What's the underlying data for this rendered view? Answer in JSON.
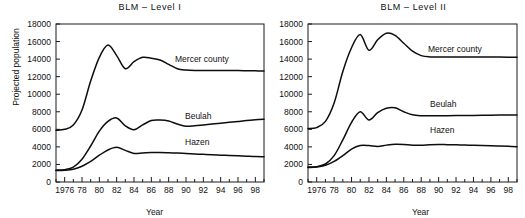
{
  "figure": {
    "ylabel": "Projected population",
    "xlabel_left": "Year",
    "xlabel_right": "Year"
  },
  "panels": [
    {
      "title": "BLM – Level I"
    },
    {
      "title": "BLM – Level II"
    }
  ],
  "series_labels": {
    "mercer": "Mercer county",
    "beulah": "Beulah",
    "hazen": "Hazen"
  },
  "axes": {
    "y_ticks": [
      "0",
      "2000",
      "4000",
      "6000",
      "8000",
      "10000",
      "12000",
      "14000",
      "16000",
      "18000"
    ],
    "x_ticks": [
      "1976",
      "78",
      "80",
      "82",
      "84",
      "86",
      "88",
      "90",
      "92",
      "94",
      "96",
      "98"
    ]
  },
  "chart_data": [
    {
      "type": "line",
      "title": "BLM – Level I",
      "xlabel": "Year",
      "ylabel": "Projected population",
      "xlim": [
        1975,
        1999
      ],
      "ylim": [
        0,
        18000
      ],
      "yticks": [
        0,
        2000,
        4000,
        6000,
        8000,
        10000,
        12000,
        14000,
        16000,
        18000
      ],
      "xticks": [
        1976,
        1978,
        1980,
        1982,
        1984,
        1986,
        1988,
        1990,
        1992,
        1994,
        1996,
        1998
      ],
      "xticklabels": [
        "1976",
        "78",
        "80",
        "82",
        "84",
        "86",
        "88",
        "90",
        "92",
        "94",
        "96",
        "98"
      ],
      "grid": false,
      "legend": "inline-annotations",
      "x": [
        1975,
        1976,
        1977,
        1978,
        1979,
        1980,
        1981,
        1982,
        1983,
        1984,
        1985,
        1986,
        1987,
        1988,
        1989,
        1990,
        1991,
        1992,
        1993,
        1994,
        1995,
        1996,
        1997,
        1998,
        1999
      ],
      "series": [
        {
          "name": "Mercer county",
          "values": [
            5900,
            6000,
            6500,
            8200,
            11500,
            14200,
            15600,
            14400,
            12900,
            13700,
            14200,
            14100,
            13900,
            13400,
            12900,
            12750,
            12700,
            12700,
            12700,
            12700,
            12700,
            12700,
            12680,
            12660,
            12650
          ]
        },
        {
          "name": "Beulah",
          "values": [
            1350,
            1400,
            1700,
            2600,
            4100,
            5800,
            6900,
            7300,
            6400,
            5950,
            6500,
            7000,
            7050,
            6950,
            6600,
            6350,
            6400,
            6500,
            6600,
            6700,
            6800,
            6900,
            7000,
            7080,
            7150
          ]
        },
        {
          "name": "Hazen",
          "values": [
            1300,
            1330,
            1450,
            1800,
            2350,
            3050,
            3650,
            3950,
            3600,
            3250,
            3300,
            3350,
            3350,
            3330,
            3300,
            3250,
            3200,
            3150,
            3100,
            3060,
            3020,
            2980,
            2940,
            2900,
            2880
          ]
        }
      ]
    },
    {
      "type": "line",
      "title": "BLM – Level II",
      "xlabel": "Year",
      "ylabel": "Projected population",
      "xlim": [
        1975,
        1999
      ],
      "ylim": [
        0,
        18000
      ],
      "yticks": [
        0,
        2000,
        4000,
        6000,
        8000,
        10000,
        12000,
        14000,
        16000,
        18000
      ],
      "xticks": [
        1976,
        1978,
        1980,
        1982,
        1984,
        1986,
        1988,
        1990,
        1992,
        1994,
        1996,
        1998
      ],
      "xticklabels": [
        "1976",
        "78",
        "80",
        "82",
        "84",
        "86",
        "88",
        "90",
        "92",
        "94",
        "96",
        "98"
      ],
      "grid": false,
      "legend": "inline-annotations",
      "x": [
        1975,
        1976,
        1977,
        1978,
        1979,
        1980,
        1981,
        1982,
        1983,
        1984,
        1985,
        1986,
        1987,
        1988,
        1989,
        1990,
        1991,
        1992,
        1993,
        1994,
        1995,
        1996,
        1997,
        1998,
        1999
      ],
      "series": [
        {
          "name": "Mercer county",
          "values": [
            6100,
            6200,
            6900,
            9000,
            12600,
            15300,
            16800,
            15000,
            16200,
            16950,
            16700,
            15800,
            14900,
            14400,
            14250,
            14250,
            14250,
            14250,
            14250,
            14250,
            14250,
            14250,
            14230,
            14210,
            14200
          ]
        },
        {
          "name": "Beulah",
          "values": [
            1700,
            1750,
            2050,
            3000,
            4800,
            6800,
            8000,
            7050,
            7900,
            8400,
            8450,
            8000,
            7650,
            7550,
            7550,
            7550,
            7560,
            7570,
            7580,
            7590,
            7600,
            7610,
            7620,
            7630,
            7640
          ]
        },
        {
          "name": "Hazen",
          "values": [
            1650,
            1700,
            1900,
            2350,
            3000,
            3750,
            4150,
            4150,
            4050,
            4200,
            4300,
            4280,
            4200,
            4200,
            4250,
            4270,
            4250,
            4230,
            4210,
            4190,
            4170,
            4140,
            4100,
            4060,
            4030
          ]
        }
      ]
    }
  ]
}
